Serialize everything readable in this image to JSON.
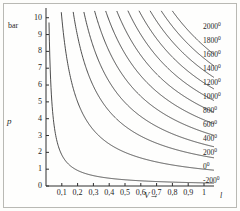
{
  "chart_data": {
    "type": "line",
    "title": "",
    "subtitle": "",
    "xlabel": "V",
    "ylabel": "p",
    "x_unit": "l",
    "y_unit": "bar",
    "xlim": [
      0,
      1.06
    ],
    "ylim": [
      0,
      10.4
    ],
    "grid": false,
    "legend_position": "right-inline",
    "x_ticks": [
      "0,1",
      "0,2",
      "0,3",
      "0,4",
      "0,5",
      "0,6",
      "0,7",
      "0,8",
      "0,9",
      "1"
    ],
    "x_tick_values": [
      0.1,
      0.2,
      0.3,
      0.4,
      0.5,
      0.6,
      0.7,
      0.8,
      0.9,
      1.0
    ],
    "y_ticks": [
      "0",
      "1",
      "2",
      "3",
      "4",
      "5",
      "6",
      "7",
      "8",
      "9",
      "10"
    ],
    "y_tick_values": [
      0,
      1,
      2,
      3,
      4,
      5,
      6,
      7,
      8,
      9,
      10
    ],
    "relation": "p = k / V",
    "series": [
      {
        "name": "-200°",
        "label": "-200",
        "degree": "0",
        "k": 0.185,
        "label_y": 181
      },
      {
        "name": "0°",
        "label": "0",
        "degree": "0",
        "k": 1.0,
        "label_y": 167
      },
      {
        "name": "200°",
        "label": "200",
        "degree": "0",
        "k": 1.78,
        "label_y": 153
      },
      {
        "name": "400°",
        "label": "400",
        "degree": "0",
        "k": 2.48,
        "label_y": 139
      },
      {
        "name": "600°",
        "label": "600",
        "degree": "0",
        "k": 3.2,
        "label_y": 125
      },
      {
        "name": "800°",
        "label": "800",
        "degree": "0",
        "k": 3.93,
        "label_y": 111
      },
      {
        "name": "1000°",
        "label": "1000",
        "degree": "0",
        "k": 4.66,
        "label_y": 97
      },
      {
        "name": "1200°",
        "label": "1200",
        "degree": "0",
        "k": 5.4,
        "label_y": 83
      },
      {
        "name": "1400°",
        "label": "1400",
        "degree": "0",
        "k": 6.13,
        "label_y": 69
      },
      {
        "name": "1600°",
        "label": "1600",
        "degree": "0",
        "k": 6.86,
        "label_y": 55
      },
      {
        "name": "1800°",
        "label": "1800",
        "degree": "0",
        "k": 7.59,
        "label_y": 41
      },
      {
        "name": "2000°",
        "label": "2000",
        "degree": "0",
        "k": 8.32,
        "label_y": 27
      }
    ]
  },
  "axes": {
    "y_unit_label": "bar",
    "x_unit_label": "l",
    "p_symbol": "p",
    "v_symbol": "V",
    "arrow_glyph": "→"
  },
  "colors": {
    "curve": "#3a3a3a",
    "axis": "#2e2e2e",
    "text": "#242424",
    "frame": "#b9b9b4",
    "background": "#fefefd"
  }
}
